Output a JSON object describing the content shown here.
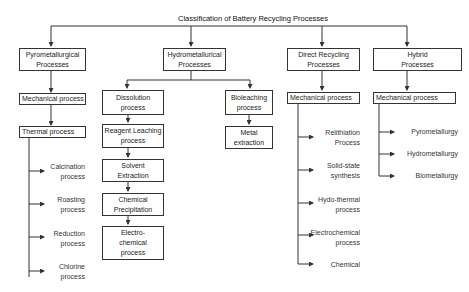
{
  "title": "Classification of Battery Recycling Processes",
  "categories": {
    "pyro": {
      "label": "Pyrometallurgical\nProcesses",
      "steps": [
        "Mechanical process",
        "Thermal process"
      ],
      "leaves": [
        "Calcination\nprocess",
        "Roasting\nprocess",
        "Reduction\nprocess",
        "Chlorine\nprocess"
      ]
    },
    "hydro": {
      "label": "Hydrometallurical\nProcesses",
      "dissolution_branch": [
        "Dissolution\nprocess",
        "Reagent Leaching\nprocess",
        "Solvent\nExtraction",
        "Chemical\nPrecipitation",
        "Electro-\nchemical\nprocess"
      ],
      "bioleaching_branch": [
        "Bioleaching\nprocess",
        "Metal\nextraction"
      ]
    },
    "direct": {
      "label": "Direct Recycling\nProcesses",
      "steps": [
        "Mechanical process"
      ],
      "leaves": [
        "Relithiation\nProcess",
        "Solid-state\nsynthesis",
        "Hydo-thermal\nprocess",
        "Electrochemical\nprocess",
        "Chemical"
      ]
    },
    "hybrid": {
      "label": "Hybrid\nProcesses",
      "steps": [
        "Mechanical process"
      ],
      "leaves": [
        "Pyrometallurgy",
        "Hydrometallurgy",
        "Biometallurgy"
      ]
    }
  }
}
